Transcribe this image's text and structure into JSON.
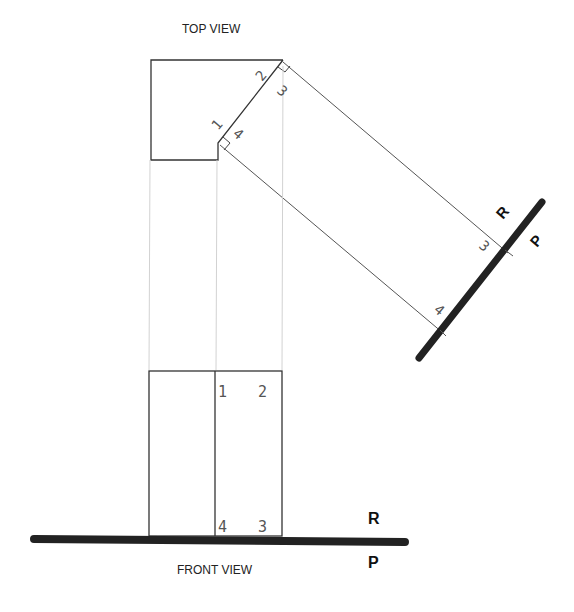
{
  "labels": {
    "top_view": "TOP VIEW",
    "front_view": "FRONT VIEW"
  },
  "planes": {
    "front_fold": {
      "upper": "R",
      "lower": "P"
    },
    "aux_fold": {
      "upper": "R",
      "lower": "P"
    }
  },
  "points": {
    "top": {
      "p1": "1",
      "p2": "2",
      "p3": "3",
      "p4": "4"
    },
    "front": {
      "p1": "1",
      "p2": "2",
      "p3": "3",
      "p4": "4"
    },
    "aux": {
      "p3": "3",
      "p4": "4"
    }
  },
  "colors": {
    "line": "#333333",
    "projector": "#c8c8c8",
    "fold": "#222222",
    "point_label": "#555555"
  }
}
